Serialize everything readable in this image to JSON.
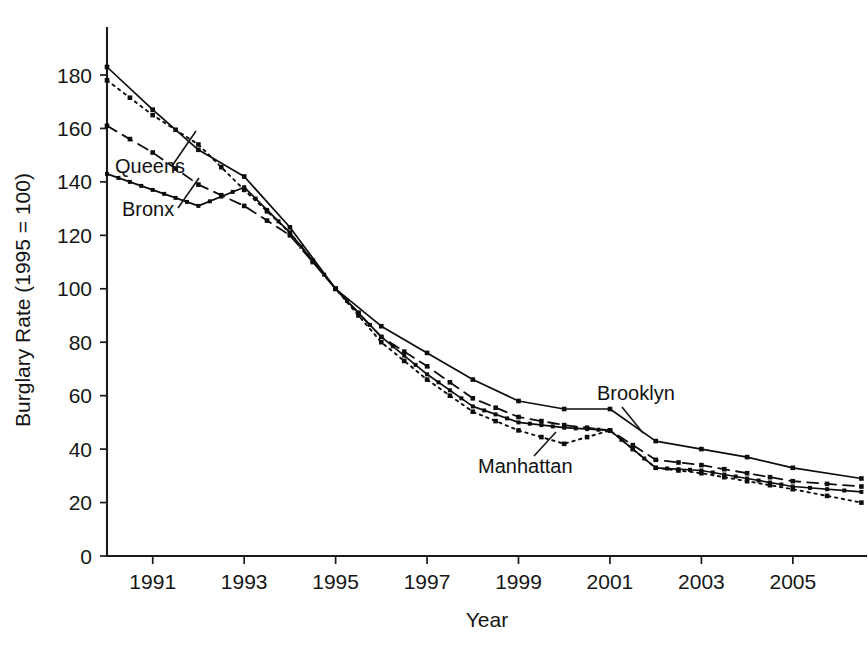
{
  "chart_data": {
    "type": "line",
    "title": "",
    "xlabel": "Year",
    "ylabel": "Burglary Rate (1995 = 100)",
    "xlim": [
      1990,
      2006.6
    ],
    "ylim": [
      0,
      190
    ],
    "grid": false,
    "legend_position": "inline-annotations",
    "x_ticks": [
      1991,
      1993,
      1995,
      1997,
      1999,
      2001,
      2003,
      2005
    ],
    "x_tick_labels": [
      "1991",
      "1993",
      "1995",
      "1997",
      "1999",
      "2001",
      "2003",
      "2005"
    ],
    "y_ticks": [
      0,
      20,
      40,
      60,
      80,
      100,
      120,
      140,
      160,
      180
    ],
    "y_tick_labels": [
      "0",
      "20",
      "40",
      "60",
      "80",
      "100",
      "120",
      "140",
      "160",
      "180"
    ],
    "x": [
      1990,
      1991,
      1992,
      1993,
      1994,
      1995,
      1996,
      1997,
      1998,
      1999,
      2000,
      2001,
      2002,
      2003,
      2004,
      2005,
      2006.5
    ],
    "series": [
      {
        "name": "Brooklyn",
        "style": "solid",
        "values": [
          183,
          167,
          152,
          142,
          123,
          100,
          86,
          76,
          66,
          58,
          55,
          55,
          43,
          40,
          37,
          33,
          29
        ]
      },
      {
        "name": "Queens",
        "style": "dashed",
        "values": [
          161,
          151,
          139,
          131,
          120,
          100,
          82,
          71,
          59,
          52,
          49,
          47,
          36,
          34,
          31,
          28,
          26
        ]
      },
      {
        "name": "Manhattan",
        "style": "dotted",
        "values": [
          178,
          165,
          154,
          137,
          121,
          100,
          80,
          66,
          54,
          47,
          42,
          47,
          33,
          31,
          28,
          25,
          20
        ]
      },
      {
        "name": "Bronx",
        "style": "solid-dense",
        "values": [
          143,
          137,
          131,
          138,
          121,
          100,
          82,
          68,
          56,
          50,
          48,
          47,
          33,
          32,
          29,
          26,
          24
        ]
      }
    ],
    "annotations": [
      {
        "text": "Queens",
        "series": "Queens"
      },
      {
        "text": "Bronx",
        "series": "Bronx"
      },
      {
        "text": "Manhattan",
        "series": "Manhattan"
      },
      {
        "text": "Brooklyn",
        "series": "Brooklyn"
      }
    ]
  }
}
